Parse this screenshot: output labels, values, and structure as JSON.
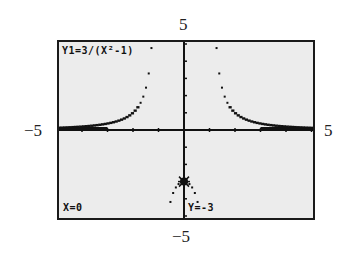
{
  "window_labels": {
    "ymax": "5",
    "ymin": "−5",
    "xmin": "−5",
    "xmax": "5"
  },
  "screen": {
    "equation": "Y1=3/(X²-1)",
    "trace_x": "X=0",
    "trace_y": "Y=-3"
  },
  "colors": {
    "lcd_background": "#ececec",
    "ink": "#111111",
    "frame": "#1a1a1a"
  },
  "chart_data": {
    "type": "line",
    "title": "Y1=3/(X²-1)",
    "function": "3/(x^2-1)",
    "xlabel": "",
    "ylabel": "",
    "xlim": [
      -5,
      5
    ],
    "ylim": [
      -5,
      5
    ],
    "xscl": 1,
    "yscl": 1,
    "grid": false,
    "vertical_asymptotes": [
      -1,
      1
    ],
    "horizontal_asymptote": 0,
    "trace_point": {
      "x": 0,
      "y": -3
    },
    "tick_labels": {
      "x": [
        "−5",
        "5"
      ],
      "y": [
        "−5",
        "5"
      ]
    },
    "sample_points": [
      {
        "x": -5,
        "y": 0.125
      },
      {
        "x": -4,
        "y": 0.2
      },
      {
        "x": -3,
        "y": 0.375
      },
      {
        "x": -2,
        "y": 1
      },
      {
        "x": -1.5,
        "y": 2.4
      },
      {
        "x": -1.25,
        "y": 5.33
      },
      {
        "x": -0.5,
        "y": -4
      },
      {
        "x": 0,
        "y": -3
      },
      {
        "x": 0.5,
        "y": -4
      },
      {
        "x": 1.25,
        "y": 5.33
      },
      {
        "x": 1.5,
        "y": 2.4
      },
      {
        "x": 2,
        "y": 1
      },
      {
        "x": 3,
        "y": 0.375
      },
      {
        "x": 4,
        "y": 0.2
      },
      {
        "x": 5,
        "y": 0.125
      }
    ]
  }
}
